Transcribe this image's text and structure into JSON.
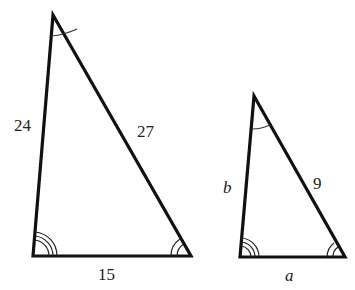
{
  "figure": {
    "large_triangle": {
      "side_left": "24",
      "side_right": "27",
      "side_bottom": "15",
      "angle_marks": {
        "apex": "single arc",
        "bottom_left": "triple arc",
        "bottom_right": "double arc"
      }
    },
    "small_triangle": {
      "side_left": "b",
      "side_right": "9",
      "side_bottom": "a",
      "angle_marks": {
        "apex": "single arc",
        "bottom_left": "triple arc",
        "bottom_right": "double arc"
      }
    }
  }
}
